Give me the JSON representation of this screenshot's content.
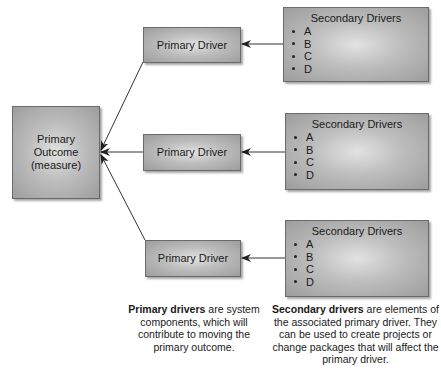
{
  "outcome": {
    "line1": "Primary",
    "line2": "Outcome",
    "line3": "(measure)"
  },
  "primary_drivers": [
    {
      "label": "Primary Driver"
    },
    {
      "label": "Primary Driver"
    },
    {
      "label": "Primary Driver"
    }
  ],
  "secondary_drivers": [
    {
      "title": "Secondary Drivers",
      "items": [
        "A",
        "B",
        "C",
        "D"
      ]
    },
    {
      "title": "Secondary Drivers",
      "items": [
        "A",
        "B",
        "C",
        "D"
      ]
    },
    {
      "title": "Secondary Drivers",
      "items": [
        "A",
        "B",
        "C",
        "D"
      ]
    }
  ],
  "captions": {
    "primary": {
      "bold": "Primary drivers",
      "rest": " are system components, which will contribute to moving the primary outcome."
    },
    "secondary": {
      "bold": "Secondary drivers",
      "rest": " are elements of the associated primary driver. They can be used to create projects or change packages that will affect the primary driver."
    }
  },
  "colors": {
    "box_edge": "#6a6a6a",
    "box_center": "#e2e2e2",
    "box_outer": "#9d9d9d",
    "line": "#222222"
  }
}
